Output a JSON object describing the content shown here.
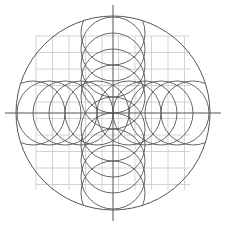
{
  "diagram": {
    "type": "geometric-construction",
    "colors": {
      "background": "#ffffff",
      "grid": "#c8c8c8",
      "lines": "#555555"
    },
    "center": [
      113,
      113
    ],
    "outer_circle_radius": 97,
    "grid": {
      "min": 36,
      "max": 190,
      "step": 16.5
    },
    "axes": {
      "min": 5,
      "max": 221
    },
    "small_circle_radius": 32,
    "small_circle_offsets": [
      16,
      48,
      80,
      32,
      64
    ]
  }
}
